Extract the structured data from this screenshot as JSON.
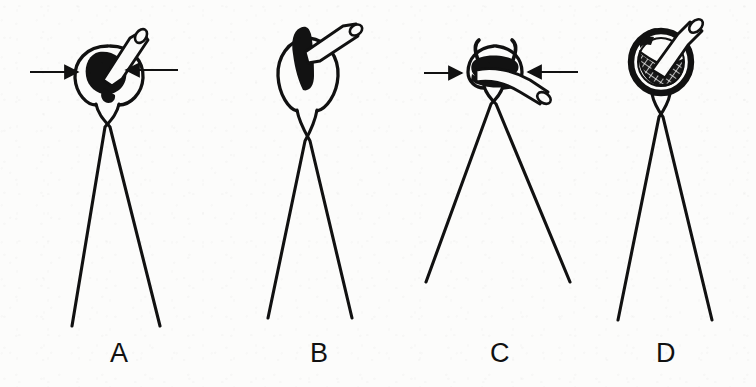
{
  "figure": {
    "kind": "line-drawing-diagram",
    "background_color": "#fcfcfb",
    "ink_color": "#111111",
    "width": 756,
    "height": 387,
    "panel_count": 4
  },
  "panels": [
    {
      "id": "panel-a",
      "label": "A",
      "label_x": 110,
      "label_y": 340,
      "center_x": 105,
      "description": "Forceps tips form an open oval ring enclosing a dark solid mass; a pale tube exits upward to the right at a steep angle. Two horizontal arrows point inward toward the ring from left and right.",
      "ring_shape": "open-oval",
      "tube_angle_label": "steep-up-right",
      "interior_fill": "solid-black",
      "has_arrows": true,
      "arrow_count": 2,
      "arrow_y": 72,
      "legs_cross_y": 126,
      "legs_bottom_y": 326
    },
    {
      "id": "panel-b",
      "label": "B",
      "label_x": 310,
      "label_y": 340,
      "center_x": 305,
      "description": "Forceps ring is rounder and taller; a narrow vertical dark mass sits inside it while the pale tube angles up and to the right. No arrows are shown.",
      "ring_shape": "round-tall",
      "tube_angle_label": "shallow-up-right",
      "interior_fill": "narrow-vertical-black",
      "has_arrows": false,
      "arrow_count": 0,
      "arrow_y": null,
      "legs_cross_y": 140,
      "legs_bottom_y": 318
    },
    {
      "id": "panel-c",
      "label": "C",
      "label_x": 490,
      "label_y": 340,
      "center_x": 492,
      "description": "The ring is compressed flat by the inward arrows; two curved horn-like flanges rise from the top edge and the pale tube lies nearly horizontal, exiting to the right. Two horizontal arrows point inward.",
      "ring_shape": "compressed-flat",
      "tube_angle_label": "near-horizontal-right",
      "interior_fill": "flattened-black-band",
      "has_arrows": true,
      "arrow_count": 2,
      "arrow_y": 73,
      "legs_cross_y": 104,
      "legs_bottom_y": 282
    },
    {
      "id": "panel-d",
      "label": "D",
      "label_x": 656,
      "label_y": 340,
      "center_x": 660,
      "description": "A thick closed dark ring contains a cross-hatched cup or bowl shape; the pale tube rises out of the cup diagonally up and to the right. No arrows are shown.",
      "ring_shape": "thick-closed",
      "tube_angle_label": "diagonal-up-right",
      "interior_fill": "cross-hatched-bowl",
      "has_arrows": false,
      "arrow_count": 0,
      "arrow_y": null,
      "legs_cross_y": 116,
      "legs_bottom_y": 320
    }
  ],
  "arrows": {
    "panel_a_left": {
      "x1": 30,
      "y1": 72,
      "x2": 82,
      "y2": 72,
      "direction": "right"
    },
    "panel_a_right": {
      "x1": 178,
      "y1": 70,
      "x2": 122,
      "y2": 70,
      "direction": "left"
    },
    "panel_c_left": {
      "x1": 424,
      "y1": 73,
      "x2": 466,
      "y2": 73,
      "direction": "right"
    },
    "panel_c_right": {
      "x1": 578,
      "y1": 72,
      "x2": 524,
      "y2": 72,
      "direction": "left"
    }
  }
}
